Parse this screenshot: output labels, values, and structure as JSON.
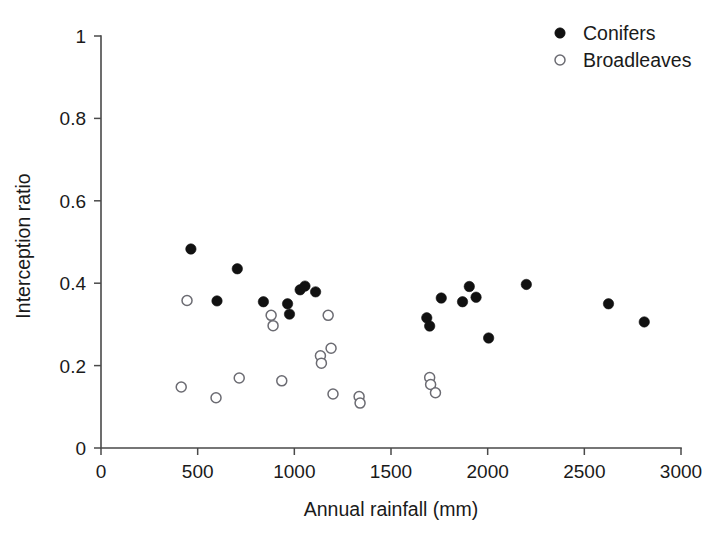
{
  "chart_data": {
    "type": "scatter",
    "title": "",
    "xlabel": "Annual rainfall (mm)",
    "ylabel": "Interception ratio",
    "xlim": [
      0,
      3000
    ],
    "ylim": [
      0,
      1
    ],
    "xticks": [
      0,
      500,
      1000,
      1500,
      2000,
      2500,
      3000
    ],
    "xtick_labels": [
      "0",
      "500",
      "1000",
      "1500",
      "2000",
      "2500",
      "3000"
    ],
    "yticks": [
      0,
      0.2,
      0.4,
      0.6,
      0.8,
      1
    ],
    "ytick_labels": [
      "0",
      "0.2",
      "0.4",
      "0.6",
      "0.8",
      "1"
    ],
    "grid": false,
    "legend_position": "top-right",
    "series": [
      {
        "name": "Conifers",
        "marker": "filled-circle",
        "color": "#111111",
        "points": [
          {
            "x": 465,
            "y": 0.483
          },
          {
            "x": 600,
            "y": 0.357
          },
          {
            "x": 705,
            "y": 0.435
          },
          {
            "x": 840,
            "y": 0.355
          },
          {
            "x": 965,
            "y": 0.35
          },
          {
            "x": 975,
            "y": 0.325
          },
          {
            "x": 1030,
            "y": 0.384
          },
          {
            "x": 1055,
            "y": 0.393
          },
          {
            "x": 1110,
            "y": 0.379
          },
          {
            "x": 1685,
            "y": 0.316
          },
          {
            "x": 1700,
            "y": 0.296
          },
          {
            "x": 1760,
            "y": 0.364
          },
          {
            "x": 1870,
            "y": 0.355
          },
          {
            "x": 1905,
            "y": 0.392
          },
          {
            "x": 1940,
            "y": 0.366
          },
          {
            "x": 2005,
            "y": 0.267
          },
          {
            "x": 2200,
            "y": 0.397
          },
          {
            "x": 2625,
            "y": 0.35
          },
          {
            "x": 2810,
            "y": 0.306
          }
        ]
      },
      {
        "name": "Broadleaves",
        "marker": "open-circle",
        "color": "#6b6b72",
        "points": [
          {
            "x": 445,
            "y": 0.358
          },
          {
            "x": 415,
            "y": 0.148
          },
          {
            "x": 595,
            "y": 0.122
          },
          {
            "x": 715,
            "y": 0.17
          },
          {
            "x": 880,
            "y": 0.322
          },
          {
            "x": 890,
            "y": 0.297
          },
          {
            "x": 935,
            "y": 0.163
          },
          {
            "x": 1175,
            "y": 0.322
          },
          {
            "x": 1135,
            "y": 0.224
          },
          {
            "x": 1140,
            "y": 0.206
          },
          {
            "x": 1190,
            "y": 0.242
          },
          {
            "x": 1200,
            "y": 0.131
          },
          {
            "x": 1335,
            "y": 0.125
          },
          {
            "x": 1340,
            "y": 0.109
          },
          {
            "x": 1700,
            "y": 0.171
          },
          {
            "x": 1705,
            "y": 0.154
          },
          {
            "x": 1730,
            "y": 0.134
          }
        ]
      }
    ]
  },
  "legend": {
    "entries": [
      {
        "label": "Conifers",
        "marker": "filled-circle"
      },
      {
        "label": "Broadleaves",
        "marker": "open-circle"
      }
    ]
  }
}
